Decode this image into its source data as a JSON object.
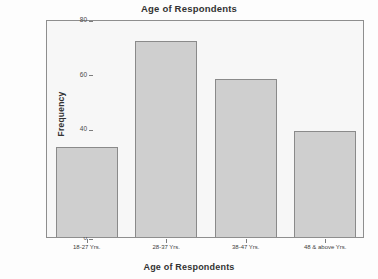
{
  "chart_data": {
    "type": "bar",
    "title": "Age of Respondents",
    "xlabel": "Age of Respondents",
    "ylabel": "Frequency",
    "categories": [
      "18-27 Yrs.",
      "28-37 Yrs.",
      "38-47 Yrs.",
      "48 & above Yrs."
    ],
    "values": [
      33,
      72,
      58,
      39
    ],
    "ylim": [
      0,
      80
    ],
    "yticks": [
      0,
      20,
      40,
      60,
      80
    ],
    "ytick_labels": [
      "0",
      "20",
      "40",
      "60",
      "80"
    ],
    "grid": false,
    "legend": "none",
    "bar_fill_color": "#cfcfcf",
    "bar_border_color": "#8a8a8a",
    "plot_background_color": "#f7f7f7",
    "figure_background_color": "#fdfdfd",
    "axis_color": "#8e8e8e"
  }
}
